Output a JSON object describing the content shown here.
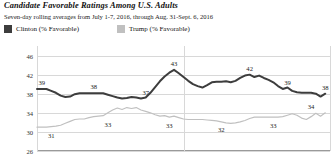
{
  "header": {
    "title": "Candidate Favorable Ratings Among U.S. Adults",
    "subtitle": "Seven-day rolling averages from July 1-7, 2016, through Aug. 31-Sept. 6, 2016"
  },
  "legend": {
    "position": "top-left",
    "items": [
      {
        "label": "Clinton (% Favorable)",
        "color": "#3d3d3d",
        "swatch": "square-swatch"
      },
      {
        "label": "Trump (% Favorable)",
        "color": "#c0c0c0",
        "swatch": "square-swatch"
      }
    ]
  },
  "chart_data": {
    "type": "line",
    "title": "Candidate Favorable Ratings Among U.S. Adults",
    "subtitle": "Seven-day rolling averages from July 1-7, 2016, through Aug. 31-Sept. 6, 2016",
    "xlabel": "",
    "ylabel": "",
    "ylim": [
      26,
      48
    ],
    "yticks": [
      46,
      42,
      38,
      34,
      30,
      26
    ],
    "grid": true,
    "xlim": [
      0,
      62
    ],
    "x_gridlines": [
      0,
      31,
      62
    ],
    "series": [
      {
        "name": "Clinton (% Favorable)",
        "color": "#3d3d3d",
        "values": [
          39,
          39,
          39,
          38.6,
          38.2,
          37.6,
          37.3,
          37.4,
          37.9,
          38.1,
          38.1,
          38.1,
          38.1,
          38.1,
          38.1,
          37.8,
          37.5,
          37.2,
          37.0,
          37.1,
          37.3,
          37.2,
          37.0,
          37.2,
          38.2,
          39.4,
          40.6,
          41.6,
          42.4,
          43.0,
          42.3,
          41.5,
          40.7,
          40.0,
          39.6,
          39.3,
          39.8,
          40.4,
          40.5,
          40.5,
          40.6,
          40.4,
          40.7,
          41.3,
          41.8,
          42.0,
          41.5,
          41.8,
          41.3,
          40.9,
          40.4,
          39.6,
          39.0,
          39.3,
          38.6,
          38.3,
          38.2,
          38.2,
          38.2,
          38.0,
          37.4,
          38.0
        ]
      },
      {
        "name": "Trump (% Favorable)",
        "color": "#c0c0c0",
        "values": [
          31,
          31,
          31,
          31.1,
          31.2,
          31.4,
          31.8,
          32.2,
          32.6,
          32.7,
          32.7,
          33.0,
          33.2,
          33.3,
          33.4,
          34.0,
          34.6,
          35.0,
          34.7,
          35.1,
          34.9,
          35.1,
          34.6,
          34.3,
          34.0,
          33.6,
          33.3,
          33.4,
          33.1,
          33.3,
          33.0,
          32.7,
          32.6,
          32.6,
          32.6,
          32.6,
          32.5,
          32.4,
          32.3,
          32.1,
          31.9,
          31.8,
          31.9,
          32.1,
          32.4,
          32.8,
          33.1,
          33.1,
          33.1,
          33.1,
          33.1,
          33.1,
          33.2,
          33.5,
          33.8,
          33.5,
          32.9,
          32.6,
          33.2,
          33.9,
          33.3,
          34.0
        ]
      }
    ],
    "annotations": [
      {
        "series": "Clinton (% Favorable)",
        "text": "39",
        "x": 1,
        "y": 39,
        "dy": -7
      },
      {
        "series": "Clinton (% Favorable)",
        "text": "38",
        "x": 12,
        "y": 38.1,
        "dy": -7
      },
      {
        "series": "Clinton (% Favorable)",
        "text": "37",
        "x": 23,
        "y": 37.0,
        "dy": -7
      },
      {
        "series": "Clinton (% Favorable)",
        "text": "43",
        "x": 29,
        "y": 43.0,
        "dy": -7
      },
      {
        "series": "Clinton (% Favorable)",
        "text": "42",
        "x": 45,
        "y": 42.0,
        "dy": -7
      },
      {
        "series": "Clinton (% Favorable)",
        "text": "39",
        "x": 53,
        "y": 39.0,
        "dy": -7
      },
      {
        "series": "Clinton (% Favorable)",
        "text": "38",
        "x": 61,
        "y": 38.0,
        "dy": -7
      },
      {
        "series": "Trump (% Favorable)",
        "text": "31",
        "x": 3,
        "y": 31.1,
        "dy": 8
      },
      {
        "series": "Trump (% Favorable)",
        "text": "33",
        "x": 15,
        "y": 33.4,
        "dy": 8
      },
      {
        "series": "Trump (% Favorable)",
        "text": "33",
        "x": 28,
        "y": 33.1,
        "dy": 8
      },
      {
        "series": "Trump (% Favorable)",
        "text": "32",
        "x": 39,
        "y": 32.3,
        "dy": 8
      },
      {
        "series": "Trump (% Favorable)",
        "text": "33",
        "x": 50,
        "y": 33.1,
        "dy": 8
      },
      {
        "series": "Trump (% Favorable)",
        "text": "34",
        "x": 58,
        "y": 34.0,
        "dy": -7
      }
    ]
  }
}
